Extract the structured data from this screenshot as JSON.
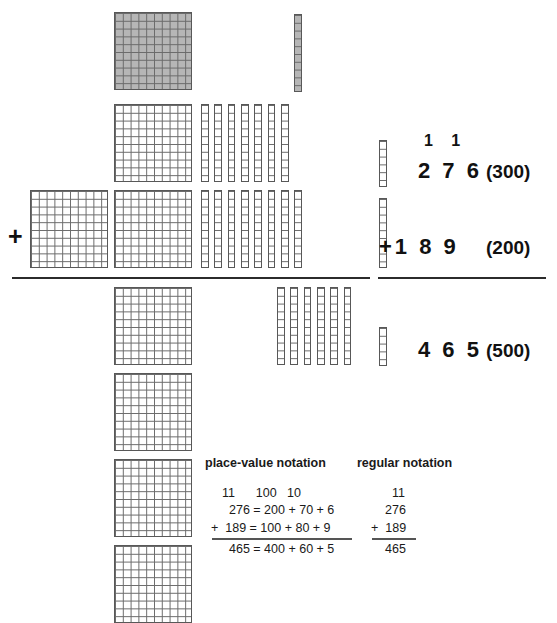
{
  "colors": {
    "ink": "#111111",
    "grid_line": "#6a6a6a",
    "block_border": "#585858",
    "shaded_fill": "#b6b6b6",
    "rule": "#2b2b2b",
    "background": "#ffffff"
  },
  "operator": {
    "plus_sign": "+"
  },
  "blocks": {
    "legend": {
      "hundred_label": "hundred-square",
      "ten_label": "ten-rod",
      "unit_label": "unit-cube"
    },
    "addend1": {
      "number": "276",
      "hundreds": 2,
      "tens": 7,
      "units": 6
    },
    "addend2": {
      "number": "189",
      "hundreds": 1,
      "tens": 8,
      "units": 9
    },
    "sum": {
      "number": "465",
      "hundreds": 4,
      "tens": 6,
      "units": 5
    },
    "regrouped": {
      "carried_hundred_label": "regrouped hundred (shaded)",
      "carried_ten_label": "regrouped ten (shaded)",
      "carried_hundred_count": 1,
      "carried_ten_count": 1
    }
  },
  "algorithm": {
    "carry_digits": "1 1",
    "addend1_digits": "2 7 6",
    "addend1_paren": "(300)",
    "operator": "+",
    "addend2_digits": "1 8 9",
    "addend2_paren": "(200)",
    "sum_digits": "4 6 5",
    "sum_paren": "(500)"
  },
  "notation": {
    "place_value_heading": "place-value notation",
    "regular_heading": "regular notation",
    "place_value": {
      "carry_line": "11      100   10",
      "line1": "276 = 200 + 70 + 6",
      "line2": "+  189 = 100 + 80 + 9",
      "line3": "465 = 400 + 60 + 5"
    },
    "regular": {
      "carry_line": "11",
      "line1": "276",
      "line2": "+  189",
      "line3": "465"
    }
  }
}
